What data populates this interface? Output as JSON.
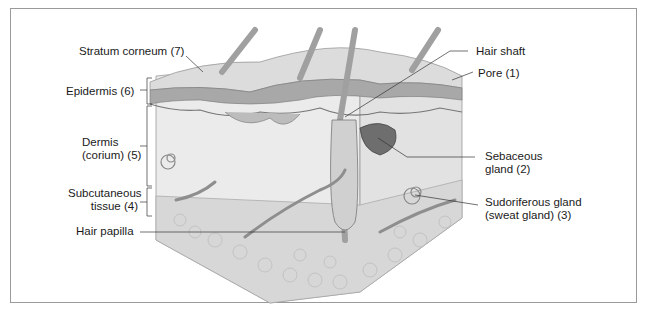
{
  "diagram": {
    "labels": {
      "stratum_corneum": "Stratum corneum (7)",
      "epidermis": "Epidermis (6)",
      "dermis_line1": "Dermis",
      "dermis_line2": "(corium) (5)",
      "subcutaneous_line1": "Subcutaneous",
      "subcutaneous_line2": "tissue (4)",
      "hair_papilla": "Hair papilla",
      "hair_shaft": "Hair shaft",
      "pore": "Pore (1)",
      "sebaceous_line1": "Sebaceous",
      "sebaceous_line2": "gland (2)",
      "sudoriferous_line1": "Sudoriferous gland",
      "sudoriferous_line2": "(sweat gland) (3)"
    },
    "colors": {
      "border": "#9a9a9a",
      "text": "#1a1a1a",
      "skin_light": "#e6e6e6",
      "skin_mid": "#c8c8c8",
      "skin_dark": "#8a8a8a",
      "leader": "#333333"
    }
  }
}
